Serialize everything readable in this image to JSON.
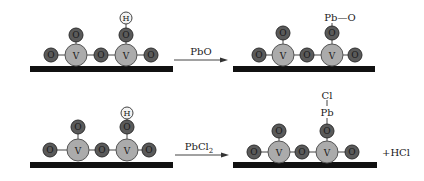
{
  "colors": {
    "oxygen_fill": "#5a5a5a",
    "oxygen_stroke": "#2e2e2e",
    "vanadium_fill": "#ababab",
    "vanadium_stroke": "#555555",
    "hydrogen_fill": "#f2f2f2",
    "hydrogen_stroke": "#444444",
    "support": "#111111"
  },
  "atoms": {
    "O": "O",
    "V": "V",
    "H": "H"
  },
  "reactions": [
    {
      "reagent": "PbO",
      "product_top": "Pb—O",
      "byproduct": ""
    },
    {
      "reagent_main": "PbCl",
      "reagent_sub": "2",
      "product_top_1": "Cl",
      "product_top_2": "Pb",
      "byproduct": "+HCl"
    }
  ]
}
